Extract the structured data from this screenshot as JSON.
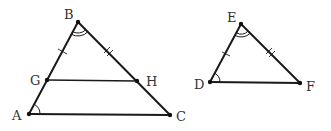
{
  "figure": {
    "triangle_left": {
      "vertices": {
        "B": {
          "label": "B",
          "x": 78,
          "y": 22
        },
        "A": {
          "label": "A",
          "x": 29,
          "y": 114
        },
        "C": {
          "label": "C",
          "x": 170,
          "y": 115
        },
        "G": {
          "label": "G",
          "x": 47,
          "y": 80
        },
        "H": {
          "label": "H",
          "x": 137,
          "y": 81
        }
      },
      "segments": [
        "AB",
        "BC",
        "AC",
        "GH"
      ],
      "marks": {
        "BG": "single tick",
        "BH": "double tick",
        "angle_B": "double arc",
        "angle_A": "single arc"
      }
    },
    "triangle_right": {
      "vertices": {
        "E": {
          "label": "E",
          "x": 241,
          "y": 24
        },
        "D": {
          "label": "D",
          "x": 210,
          "y": 82
        },
        "F": {
          "label": "F",
          "x": 300,
          "y": 83
        }
      },
      "segments": [
        "DE",
        "EF",
        "DF"
      ],
      "marks": {
        "DE": "single tick",
        "EF": "double tick",
        "angle_E": "double arc",
        "angle_D": "single arc"
      }
    }
  }
}
